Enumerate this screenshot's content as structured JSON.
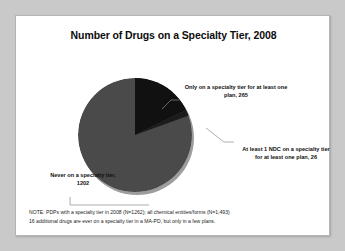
{
  "slide": {
    "title": "Number of Drugs on a Specialty Tier, 2008",
    "footnote": {
      "line1": "NOTE: PDPs with a specialty tier in 2008 (N=1262); all chemical entities/forms (N=1,493)",
      "line2": "16 additional drugs are ever on a specialty tier in a MA-PD, but only in a few plans."
    }
  },
  "labels": {
    "only_specialty": "Only on a specialty tier for at least one plan, 265",
    "at_least_1_ndc": "At least 1 NDC on a specialty tier for at least one plan, 26",
    "never": "Never on a specialty tier, 1202"
  },
  "chart_data": {
    "type": "pie",
    "title": "Number of Drugs on a Specialty Tier, 2008",
    "categories": [
      "Only on a specialty tier for at least one plan",
      "At least 1 NDC on a specialty tier for at least one plan",
      "Never on a specialty tier"
    ],
    "values": [
      265,
      26,
      1202
    ],
    "total": 1493,
    "colors": [
      "#111111",
      "#1c1c1c",
      "#4a4a4a"
    ],
    "legend_position": "none",
    "data_labels": [
      "265",
      "26",
      "1202"
    ],
    "grid": false
  }
}
